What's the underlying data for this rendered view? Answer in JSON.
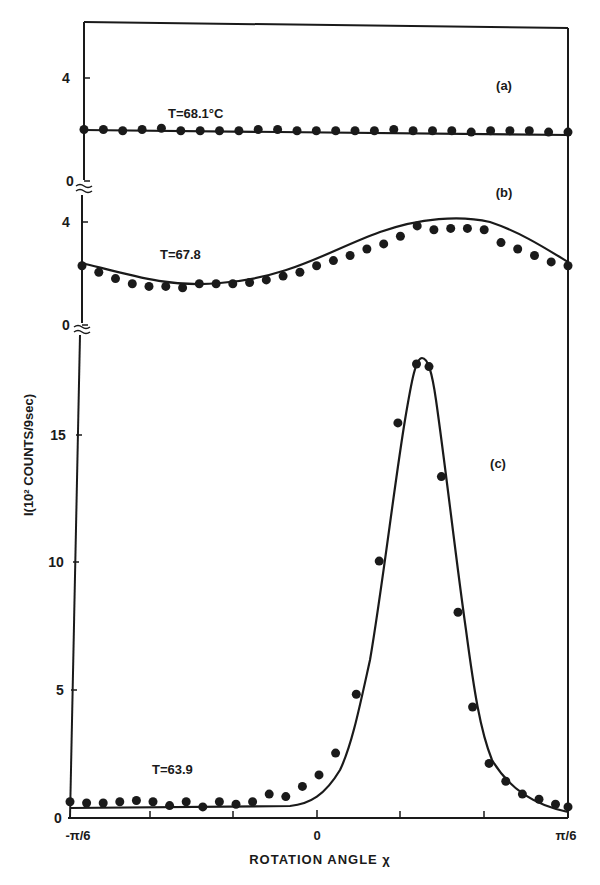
{
  "chart_data": {
    "type": "line",
    "title": "",
    "xlabel": "ROTATION ANGLE χ",
    "ylabel": "I(10² COUNTS/9sec)",
    "x_ticks": [
      "-π/6",
      "0",
      "π/6"
    ],
    "x_range": [
      "-π/6",
      "π/6"
    ],
    "grid": false,
    "legend": "none",
    "panels": [
      {
        "id": "a",
        "label": "(a)",
        "annotation": "T=68.1°C",
        "y_ticks": [
          "0",
          "4"
        ],
        "ylim": [
          0,
          5.8
        ],
        "x_frac": [
          0.0,
          0.04,
          0.08,
          0.12,
          0.16,
          0.2,
          0.24,
          0.28,
          0.32,
          0.36,
          0.4,
          0.44,
          0.48,
          0.52,
          0.56,
          0.6,
          0.64,
          0.68,
          0.72,
          0.76,
          0.8,
          0.84,
          0.88,
          0.92,
          0.96,
          1.0
        ],
        "values": [
          2.0,
          2.0,
          1.95,
          2.0,
          2.05,
          1.95,
          1.95,
          1.95,
          1.95,
          2.0,
          2.0,
          1.95,
          1.95,
          1.95,
          1.95,
          1.95,
          2.0,
          1.95,
          1.95,
          1.95,
          1.9,
          1.95,
          1.95,
          1.95,
          1.9,
          1.9
        ],
        "fit": "flat"
      },
      {
        "id": "b",
        "label": "(b)",
        "annotation": "T=67.8",
        "y_ticks": [
          "0",
          "4"
        ],
        "ylim": [
          0,
          4.8
        ],
        "x_frac": [
          0.0,
          0.04,
          0.08,
          0.12,
          0.16,
          0.2,
          0.24,
          0.28,
          0.32,
          0.36,
          0.4,
          0.44,
          0.48,
          0.52,
          0.56,
          0.6,
          0.64,
          0.68,
          0.72,
          0.76,
          0.8,
          0.84,
          0.88,
          0.92,
          0.96,
          1.0
        ],
        "values": [
          2.3,
          2.05,
          1.8,
          1.6,
          1.5,
          1.5,
          1.45,
          1.6,
          1.6,
          1.6,
          1.65,
          1.75,
          1.9,
          2.05,
          2.3,
          2.5,
          2.7,
          2.95,
          3.15,
          3.45,
          3.85,
          3.7,
          3.75,
          3.75,
          3.7,
          3.2,
          2.95,
          2.7,
          2.45,
          2.3
        ],
        "fit": "smooth, min ≈1.5 near x=-π/10, max ≈3.8 near x=π/12"
      },
      {
        "id": "c",
        "label": "(c)",
        "annotation": "T=63.9",
        "y_ticks": [
          "0",
          "5",
          "10",
          "15"
        ],
        "ylim": [
          0,
          18.5
        ],
        "points": [
          [
            0.0,
            0.4
          ],
          [
            0.04,
            0.35
          ],
          [
            0.08,
            0.35
          ],
          [
            0.12,
            0.4
          ],
          [
            0.16,
            0.45
          ],
          [
            0.2,
            0.4
          ],
          [
            0.24,
            0.25
          ],
          [
            0.28,
            0.4
          ],
          [
            0.32,
            0.2
          ],
          [
            0.36,
            0.4
          ],
          [
            0.4,
            0.3
          ],
          [
            0.44,
            0.4
          ],
          [
            0.48,
            0.7
          ],
          [
            0.52,
            0.6
          ],
          [
            0.56,
            1.0
          ],
          [
            0.6,
            1.45
          ],
          [
            0.64,
            2.3
          ],
          [
            0.69,
            4.6
          ],
          [
            0.745,
            9.8
          ],
          [
            0.79,
            15.2
          ],
          [
            0.835,
            17.5
          ],
          [
            0.865,
            17.4
          ],
          [
            0.895,
            13.1
          ],
          [
            0.935,
            7.8
          ],
          [
            0.97,
            4.1
          ],
          [
            1.01,
            1.9
          ],
          [
            1.05,
            1.2
          ],
          [
            1.09,
            0.7
          ],
          [
            1.13,
            0.5
          ],
          [
            1.17,
            0.3
          ],
          [
            1.2,
            0.2
          ]
        ],
        "peak": {
          "x": "≈π/12",
          "y": 18
        },
        "fit": "sharp peak"
      }
    ]
  },
  "axis": {
    "ylabel": "I(10² COUNTS/9sec)",
    "xlabel": "ROTATION ANGLE χ",
    "x_ticks": [
      "-π/6",
      "0",
      "π/6"
    ]
  },
  "panels": {
    "a": {
      "label": "(a)",
      "annotation": "T=68.1°C",
      "tick_0": "0",
      "tick_4": "4"
    },
    "b": {
      "label": "(b)",
      "annotation": "T=67.8",
      "tick_0": "0",
      "tick_4": "4"
    },
    "c": {
      "label": "(c)",
      "annotation": "T=63.9",
      "tick_0": "0",
      "tick_5": "5",
      "tick_10": "10",
      "tick_15": "15"
    }
  }
}
